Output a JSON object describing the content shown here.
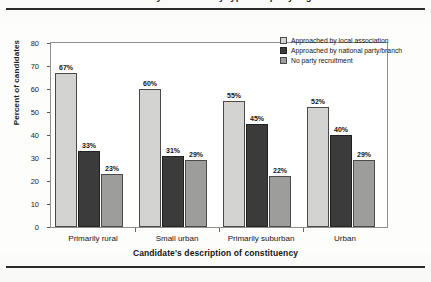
{
  "figure": {
    "title_cutoff": "Recruitment of candidates by constituency type and party organisation",
    "rule_color": "#2b2b2b"
  },
  "chart_data": {
    "type": "bar",
    "title": "",
    "xlabel": "Candidate's description of constituency",
    "ylabel": "Percent of candidates",
    "ylim": [
      0,
      80
    ],
    "yticks": [
      0,
      10,
      20,
      30,
      40,
      50,
      60,
      70,
      80
    ],
    "ytick_labels": [
      "0",
      "10",
      "20",
      "30",
      "40",
      "50",
      "60",
      "70",
      "80"
    ],
    "grid": false,
    "legend_position": "top-right",
    "categories": [
      "Primarily rural",
      "Small urban",
      "Primarily suburban",
      "Urban"
    ],
    "series": [
      {
        "name": "Approached by local association",
        "color": "#d3d3d1",
        "values": [
          67,
          60,
          55,
          52
        ],
        "labels": [
          "67%",
          "60%",
          "55%",
          "52%"
        ]
      },
      {
        "name": "Approached by national party/branch",
        "color": "#3b3b3b",
        "values": [
          33,
          31,
          45,
          40
        ],
        "labels": [
          "33%",
          "31%",
          "45%",
          "40%"
        ]
      },
      {
        "name": "No party recruitment",
        "color": "#9d9d9b",
        "values": [
          23,
          29,
          22,
          29
        ],
        "labels": [
          "23%",
          "29%",
          "22%",
          "29%"
        ]
      }
    ]
  }
}
